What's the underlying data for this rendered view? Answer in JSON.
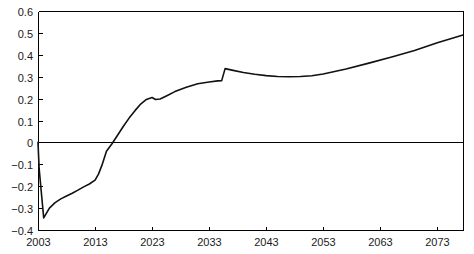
{
  "chart_data": {
    "type": "line",
    "title": "",
    "subtitle": "",
    "xlabel": "",
    "ylabel": "",
    "xlim": [
      2003,
      2077.5
    ],
    "ylim": [
      -0.4,
      0.6
    ],
    "grid": false,
    "legend": null,
    "zero_line": 0,
    "x_ticks": [
      2003,
      2013,
      2023,
      2033,
      2043,
      2053,
      2063,
      2073
    ],
    "x_tick_labels": [
      "2003",
      "2013",
      "2023",
      "2033",
      "2043",
      "2053",
      "2063",
      "2073"
    ],
    "y_ticks": [
      -0.4,
      -0.3,
      -0.2,
      -0.1,
      0,
      0.1,
      0.2,
      0.3,
      0.4,
      0.5,
      0.6
    ],
    "y_tick_labels": [
      "−0.4",
      "−0.3",
      "−0.2",
      "−0.1",
      "0",
      "0.1",
      "0.2",
      "0.3",
      "0.4",
      "0.5",
      "0.6"
    ],
    "series": [
      {
        "name": "series-1",
        "color": "#111111",
        "x": [
          2003,
          2003.2,
          2004.0,
          2005.0,
          2006.0,
          2007.0,
          2008.0,
          2009.0,
          2010.0,
          2011.0,
          2012.0,
          2013.0,
          2013.6,
          2014.2,
          2015.0,
          2016.0,
          2017.0,
          2018.0,
          2019.0,
          2020.0,
          2021.0,
          2022.0,
          2023.0,
          2023.6,
          2024.4,
          2025.5,
          2027.0,
          2029.0,
          2031.0,
          2033.0,
          2034.5,
          2035.2,
          2035.8,
          2037.0,
          2039.0,
          2041.0,
          2043.0,
          2045.0,
          2047.0,
          2049.0,
          2051.0,
          2053.0,
          2057.0,
          2061.0,
          2065.0,
          2069.0,
          2073.0,
          2077.5
        ],
        "y": [
          0.0,
          -0.12,
          -0.345,
          -0.3,
          -0.275,
          -0.258,
          -0.245,
          -0.232,
          -0.218,
          -0.203,
          -0.19,
          -0.172,
          -0.145,
          -0.105,
          -0.04,
          -0.005,
          0.035,
          0.075,
          0.112,
          0.145,
          0.175,
          0.196,
          0.205,
          0.196,
          0.198,
          0.212,
          0.232,
          0.252,
          0.268,
          0.276,
          0.281,
          0.282,
          0.337,
          0.33,
          0.319,
          0.311,
          0.305,
          0.301,
          0.3,
          0.301,
          0.304,
          0.312,
          0.335,
          0.362,
          0.39,
          0.42,
          0.455,
          0.49
        ]
      }
    ],
    "annotations": []
  },
  "plot": {
    "left_px": 38,
    "right_px": 463,
    "top_px": 11,
    "bottom_px": 230
  }
}
